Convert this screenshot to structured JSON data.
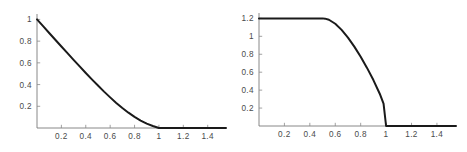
{
  "figure": {
    "background_color": "#ffffff",
    "curve_color": "#1a1a1a",
    "axis_color": "#7a7a7a",
    "label_color": "#4a4a4a",
    "panel_count": 2
  },
  "chart_data": [
    {
      "type": "line",
      "title": "",
      "subtitle": "",
      "xlabel": "",
      "ylabel": "",
      "grid": false,
      "legend": null,
      "legend_position": "none",
      "xlim": [
        0,
        1.55
      ],
      "ylim": [
        0,
        1.05
      ],
      "xticks": [
        0.2,
        0.4,
        0.6,
        0.8,
        1,
        1.2,
        1.4
      ],
      "xtick_labels": [
        "0.2",
        "0.4",
        "0.6",
        "0.8",
        "1",
        "1.2",
        "1.4"
      ],
      "yticks": [
        0.2,
        0.4,
        0.6,
        0.8,
        1
      ],
      "ytick_labels": [
        "0.2",
        "0.4",
        "0.6",
        "0.8",
        "1"
      ],
      "series": [
        {
          "name": "curve-left",
          "x": [
            0,
            0.05,
            0.1,
            0.15,
            0.2,
            0.25,
            0.3,
            0.35,
            0.4,
            0.45,
            0.5,
            0.55,
            0.6,
            0.65,
            0.7,
            0.75,
            0.8,
            0.85,
            0.9,
            0.95,
            1,
            1.1,
            1.2,
            1.3,
            1.4,
            1.5,
            1.55
          ],
          "y": [
            1,
            0.938,
            0.875,
            0.813,
            0.751,
            0.689,
            0.628,
            0.567,
            0.507,
            0.448,
            0.391,
            0.335,
            0.282,
            0.231,
            0.184,
            0.141,
            0.102,
            0.068,
            0.04,
            0.018,
            0,
            0,
            0,
            0,
            0,
            0,
            0
          ]
        }
      ]
    },
    {
      "type": "line",
      "title": "",
      "subtitle": "",
      "xlabel": "",
      "ylabel": "",
      "grid": false,
      "legend": null,
      "legend_position": "none",
      "xlim": [
        0,
        1.55
      ],
      "ylim": [
        0,
        1.26
      ],
      "xticks": [
        0.2,
        0.4,
        0.6,
        0.8,
        1,
        1.2,
        1.4
      ],
      "xtick_labels": [
        "0.2",
        "0.4",
        "0.6",
        "0.8",
        "1",
        "1.2",
        "1.4"
      ],
      "yticks": [
        0.2,
        0.4,
        0.6,
        0.8,
        1,
        1.2
      ],
      "ytick_labels": [
        "0.2",
        "0.4",
        "0.6",
        "0.8",
        "1",
        "1.2"
      ],
      "series": [
        {
          "name": "curve-right",
          "x": [
            0,
            0.1,
            0.2,
            0.3,
            0.4,
            0.45,
            0.5,
            0.52,
            0.55,
            0.6,
            0.65,
            0.7,
            0.75,
            0.8,
            0.85,
            0.9,
            0.95,
            0.98,
            1,
            1.05,
            1.1,
            1.2,
            1.3,
            1.4,
            1.5,
            1.55
          ],
          "y": [
            1.2,
            1.2,
            1.2,
            1.2,
            1.2,
            1.2,
            1.2,
            1.197,
            1.185,
            1.14,
            1.072,
            0.985,
            0.885,
            0.772,
            0.648,
            0.512,
            0.36,
            0.25,
            0,
            0,
            0,
            0,
            0,
            0,
            0,
            0
          ]
        }
      ]
    }
  ]
}
